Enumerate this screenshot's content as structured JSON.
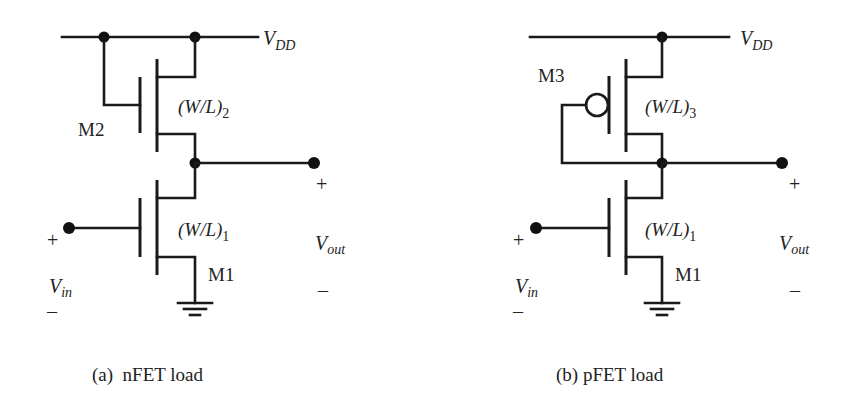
{
  "figure": {
    "colors": {
      "ink": "#1a1a1a",
      "background": "#ffffff"
    },
    "panel_a": {
      "caption": "(a)  nFET load",
      "supply": {
        "symbol": "V",
        "subscript": "DD"
      },
      "load_transistor": {
        "name": "M2",
        "ratio_prefix": "(W/L)",
        "ratio_sub": "2",
        "type": "nFET",
        "connection": "gate tied to VDD"
      },
      "driver_transistor": {
        "name": "M1",
        "ratio_prefix": "(W/L)",
        "ratio_sub": "1",
        "type": "nFET"
      },
      "input": {
        "symbol": "V",
        "subscript": "in",
        "plus": "+",
        "minus": "–"
      },
      "output": {
        "symbol": "V",
        "subscript": "out",
        "plus": "+",
        "minus": "–"
      }
    },
    "panel_b": {
      "caption": "(b) pFET load",
      "supply": {
        "symbol": "V",
        "subscript": "DD"
      },
      "load_transistor": {
        "name": "M3",
        "ratio_prefix": "(W/L)",
        "ratio_sub": "3",
        "type": "pFET",
        "connection": "gate tied to output"
      },
      "driver_transistor": {
        "name": "M1",
        "ratio_prefix": "(W/L)",
        "ratio_sub": "1",
        "type": "nFET"
      },
      "input": {
        "symbol": "V",
        "subscript": "in",
        "plus": "+",
        "minus": "–"
      },
      "output": {
        "symbol": "V",
        "subscript": "out",
        "plus": "+",
        "minus": "–"
      }
    }
  }
}
